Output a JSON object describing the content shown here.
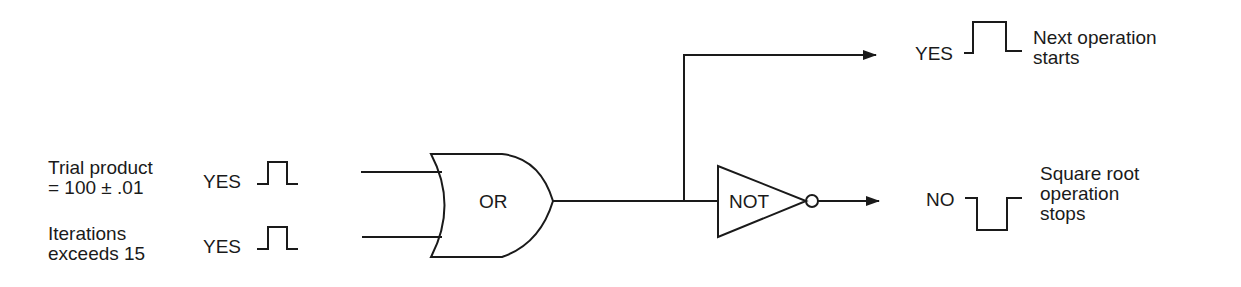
{
  "inputs": [
    {
      "label_line1": "Trial product",
      "label_line2": "= 100 ± .01",
      "signal": "YES"
    },
    {
      "label_line1": "Iterations",
      "label_line2": "exceeds 15",
      "signal": "YES"
    }
  ],
  "gates": {
    "or_label": "OR",
    "not_label": "NOT"
  },
  "outputs": [
    {
      "signal": "YES",
      "label_line1": "Next operation",
      "label_line2": "starts"
    },
    {
      "signal": "NO",
      "label_line1": "Square root",
      "label_line2": "operation",
      "label_line3": "stops"
    }
  ],
  "colors": {
    "line": "#1a1a1a",
    "background": "#ffffff"
  }
}
